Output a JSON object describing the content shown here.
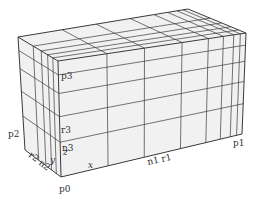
{
  "diagram": {
    "type": "3d-grid-box",
    "colors": {
      "background": "#ffffff",
      "face_fill": "#f1f1f1",
      "line": "#3a3a3a",
      "text": "#333333"
    },
    "labels": {
      "p0": "p0",
      "p1": "p1",
      "p2": "p2",
      "p3": "p3",
      "x": "x",
      "y": "y",
      "z": "z",
      "n1r1": "n1 r1",
      "r2n2": "r2 n2",
      "r3": "r3",
      "n3": "n3"
    },
    "corners": {
      "front_bottom_left": [
        61,
        177
      ],
      "front_top_left": [
        58,
        61
      ],
      "front_bottom_right": [
        242,
        134
      ],
      "front_top_right": [
        246,
        33
      ],
      "back_top_left": [
        18,
        37
      ],
      "back_bottom_left": [
        25,
        150
      ],
      "back_top_right": [
        188,
        9
      ]
    },
    "front_vertical_fracs": [
      0.26,
      0.46,
      0.66,
      0.8,
      0.88,
      0.935,
      0.97
    ],
    "front_horizontal_fracs": [
      0.12,
      0.28,
      0.48,
      0.7
    ],
    "depth_fracs": [
      0.13,
      0.26,
      0.42,
      0.62
    ]
  }
}
